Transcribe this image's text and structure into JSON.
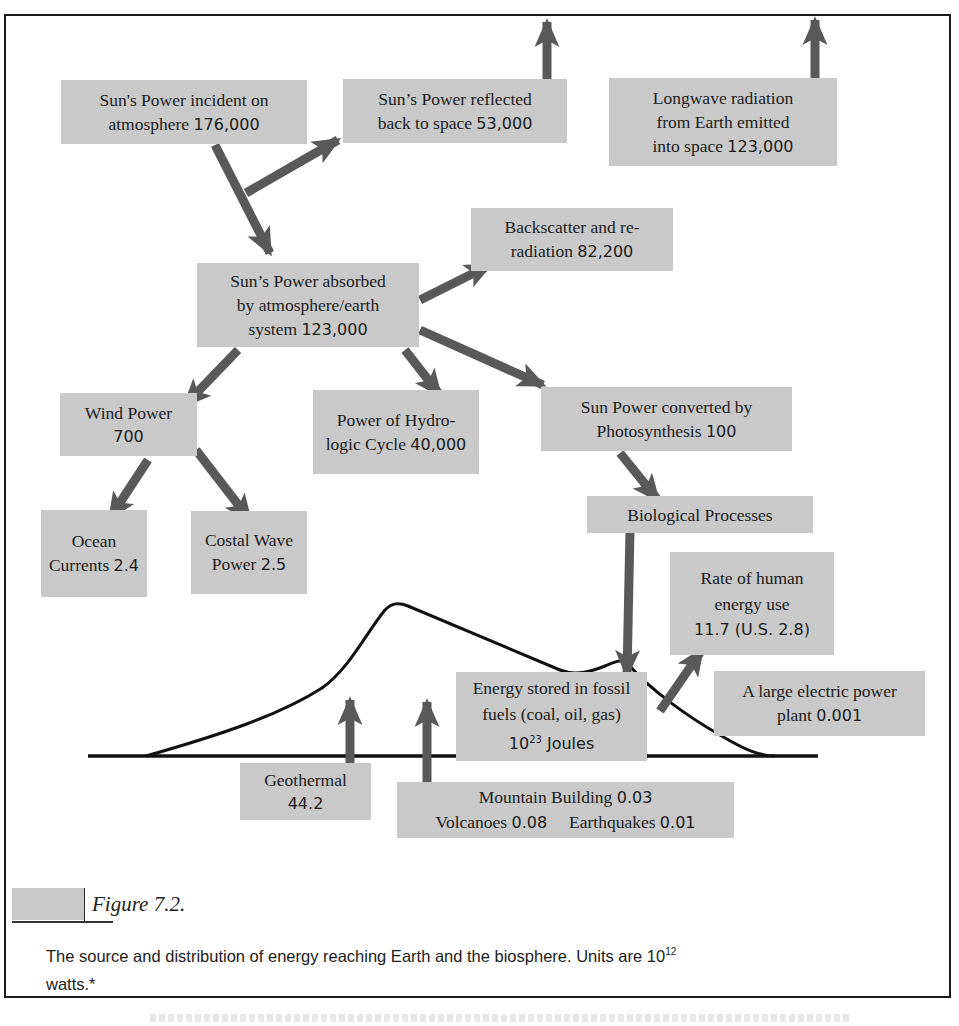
{
  "diagram": {
    "arrow_color": "#595959",
    "box_color": "#c9c9c9",
    "curve_color": "#111111",
    "nodes": {
      "incident": {
        "text": "Sun's Power incident on",
        "line2": "atmosphere",
        "value": "176,000"
      },
      "reflected": {
        "text": "Sun’s Power reflected",
        "line2": "back to space",
        "value": "53,000"
      },
      "longwave": {
        "text": "Longwave radiation",
        "line2": "from Earth emitted",
        "line3": "into space",
        "value": "123,000"
      },
      "backscatter": {
        "text": "Backscatter and re-",
        "line2": "radiation",
        "value": "82,200"
      },
      "absorbed": {
        "text": "Sun’s Power absorbed",
        "line2": "by atmosphere/earth",
        "line3": "system",
        "value": "123,000"
      },
      "wind": {
        "text": "Wind Power",
        "value": "700"
      },
      "hydro": {
        "text": "Power of Hydro-",
        "line2": "logic Cycle",
        "value": "40,000"
      },
      "photosynthesis": {
        "text": "Sun Power converted by",
        "line2": "Photosynthesis",
        "value": "100"
      },
      "ocean": {
        "text": "Ocean",
        "line2": "Currents",
        "value": "2.4"
      },
      "coastal": {
        "text": "Costal Wave",
        "line2": "Power",
        "value": "2.5"
      },
      "biological": {
        "text": "Biological Processes"
      },
      "human": {
        "text": "Rate of human",
        "line2": "energy use",
        "value": "11.7 (U.S. 2.8)"
      },
      "fossil": {
        "text": "Energy stored in fossil",
        "line2": "fuels (coal, oil, gas)",
        "value_base": "10",
        "value_exp": "23",
        "value_unit": " Joules"
      },
      "power_plant": {
        "text": "A large electric power",
        "line2": "plant",
        "value": "0.001"
      },
      "geothermal": {
        "text": "Geothermal",
        "value": "44.2"
      },
      "tectonic": {
        "mountain_label": "Mountain Building",
        "mountain_value": "0.03",
        "volcano_label": "Volcanoes",
        "volcano_value": "0.08",
        "earthquake_label": "Earthquakes",
        "earthquake_value": "0.01"
      }
    }
  },
  "caption": {
    "figure_label": "Figure 7.2.",
    "text_before": "The source and distribution of energy reaching Earth and the biosphere. Units are 10",
    "exponent": "12",
    "text_after": " watts.*"
  }
}
